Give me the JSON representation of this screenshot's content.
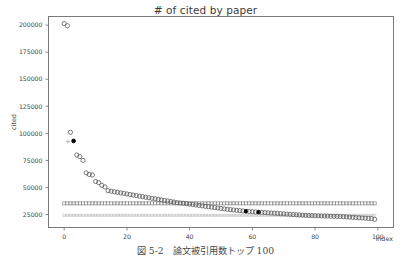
{
  "figure": {
    "title": "# of cited by paper",
    "caption": "図 5-2　論文被引用数トップ 100",
    "background_color": "#ffffff",
    "frame_color": "#7a7a7a"
  },
  "chart_data": {
    "type": "scatter",
    "title": "# of cited by paper",
    "xlabel": "index",
    "ylabel": "cited",
    "xlim": [
      -5,
      105
    ],
    "ylim": [
      13000,
      208000
    ],
    "xticks": [
      0,
      20,
      40,
      60,
      80,
      100
    ],
    "xtick_labels": [
      "0",
      "20",
      "40",
      "60",
      "80",
      "100"
    ],
    "yticks": [
      25000,
      50000,
      75000,
      100000,
      125000,
      150000,
      175000,
      200000
    ],
    "ytick_labels": [
      "25000",
      "50000",
      "75000",
      "100000",
      "125000",
      "150000",
      "175000",
      "200000"
    ],
    "grid": false,
    "legend": "none",
    "series": [
      {
        "name": "cited-count-top100",
        "marker": "open-circle",
        "color": "#5a5a5a",
        "x": [
          0,
          1,
          2,
          3,
          4,
          5,
          6,
          7,
          8,
          9,
          10,
          11,
          12,
          13,
          14,
          15,
          16,
          17,
          18,
          19,
          20,
          21,
          22,
          23,
          24,
          25,
          26,
          27,
          28,
          29,
          30,
          31,
          32,
          33,
          34,
          35,
          36,
          37,
          38,
          39,
          40,
          41,
          42,
          43,
          44,
          45,
          46,
          47,
          48,
          49,
          50,
          51,
          52,
          53,
          54,
          55,
          56,
          57,
          58,
          59,
          60,
          61,
          62,
          63,
          64,
          65,
          66,
          67,
          68,
          69,
          70,
          71,
          72,
          73,
          74,
          75,
          76,
          77,
          78,
          79,
          80,
          81,
          82,
          83,
          84,
          85,
          86,
          87,
          88,
          89,
          90,
          91,
          92,
          93,
          94,
          95,
          96,
          97,
          98,
          99
        ],
        "y": [
          201500,
          199500,
          101000,
          93000,
          80000,
          78500,
          75000,
          63500,
          62000,
          61500,
          55500,
          54500,
          52000,
          50500,
          47000,
          46500,
          46000,
          45500,
          45000,
          44500,
          44000,
          43500,
          43000,
          42500,
          42000,
          41500,
          41000,
          40500,
          40000,
          39500,
          39000,
          38500,
          38000,
          37500,
          37000,
          36500,
          36000,
          35700,
          35400,
          35000,
          34600,
          34200,
          33800,
          33400,
          33000,
          32600,
          32200,
          31800,
          31400,
          31000,
          30600,
          30200,
          29800,
          29500,
          29200,
          28900,
          28600,
          28300,
          28000,
          27800,
          27600,
          27400,
          27200,
          27000,
          26800,
          26600,
          26400,
          26200,
          26000,
          25800,
          25600,
          25400,
          25200,
          25000,
          24800,
          24600,
          24400,
          24200,
          24100,
          24000,
          23900,
          23800,
          23700,
          23600,
          23500,
          23400,
          23300,
          23200,
          23100,
          23000,
          22800,
          22600,
          22400,
          22200,
          22000,
          21800,
          21600,
          21400,
          21200,
          20500
        ],
        "highlighted_indices": [
          3,
          58,
          62
        ],
        "highlight_color": "#000000"
      },
      {
        "name": "reference-band",
        "marker": "open-square",
        "color": "#8a8a8a",
        "constant_y": 35300,
        "x_range": [
          0,
          99
        ]
      },
      {
        "name": "baseline-faint",
        "marker": "dot",
        "color": "#c0c0c0",
        "constant_y": 24200,
        "x_range": [
          0,
          99
        ]
      }
    ],
    "annotations": [
      {
        "name": "plus-marker",
        "x": 1.2,
        "y": 92500,
        "glyph": "+",
        "color": "#9a9a9a"
      }
    ]
  }
}
